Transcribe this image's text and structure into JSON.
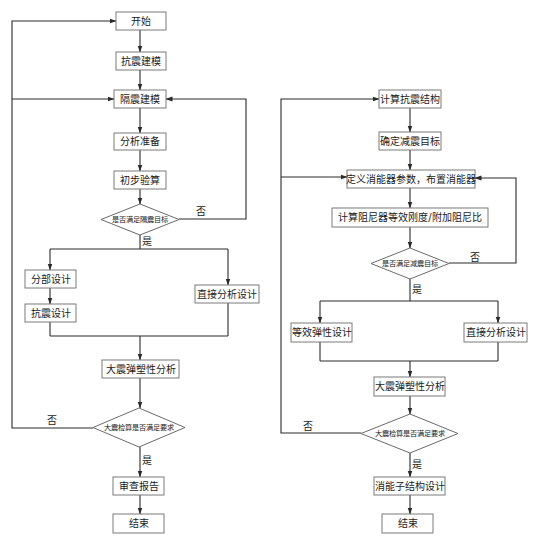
{
  "left_flowchart": {
    "nodes": {
      "start": "开始",
      "seismic_modeling": "抗震建模",
      "isolation_modeling": "隔震建模",
      "analysis_prep": "分析准备",
      "preliminary_check": "初步验算",
      "decision_isolation_target": "是否满足隔震目标",
      "partial_design": "分部设计",
      "seismic_design": "抗震设计",
      "direct_analysis_design": "直接分析设计",
      "rare_eq_elastoplastic_analysis": "大震弹塑性分析",
      "decision_rare_eq_check": "大震检算是否满足要求",
      "review_report": "审查报告",
      "end": "结束"
    },
    "edge_labels": {
      "d1_no": "否",
      "d1_yes": "是",
      "d2_no": "否",
      "d2_yes": "是"
    }
  },
  "right_flowchart": {
    "nodes": {
      "compute_seismic_structure": "计算抗震结构",
      "determine_damping_target": "确定减震目标",
      "define_dampers": "定义消能器参数，布置消能器",
      "compute_damper_stiffness": "计算阻尼器等效刚度/附加阻尼比",
      "decision_damping_target": "是否满足减震目标",
      "equivalent_elastic_design": "等效弹性设计",
      "direct_analysis_design": "直接分析设计",
      "rare_eq_elastoplastic_analysis": "大震弹塑性分析",
      "decision_rare_eq_check": "大震检算是否满足要求",
      "energy_dissipation_substructure_design": "消能子结构设计",
      "end": "结束"
    },
    "edge_labels": {
      "d1_no": "否",
      "d1_yes": "是",
      "d2_no": "否",
      "d2_yes": "是"
    }
  },
  "colors": {
    "line": "#2a2a2a",
    "box_border": "#7a7a7a",
    "text": "#222222",
    "background": "#ffffff"
  }
}
